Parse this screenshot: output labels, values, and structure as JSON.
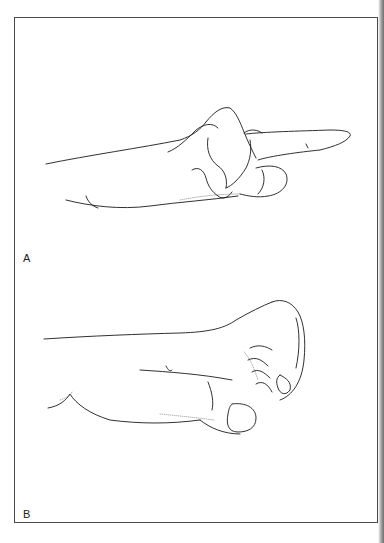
{
  "figure": {
    "panels": [
      {
        "label": "A",
        "description": "hand-with-extended-index-finger"
      },
      {
        "label": "B",
        "description": "hand-with-flexed-fingers-fist"
      }
    ],
    "colors": {
      "line": "#1a1a1a",
      "frame": "#4a4a4a",
      "background": "#ffffff"
    }
  }
}
